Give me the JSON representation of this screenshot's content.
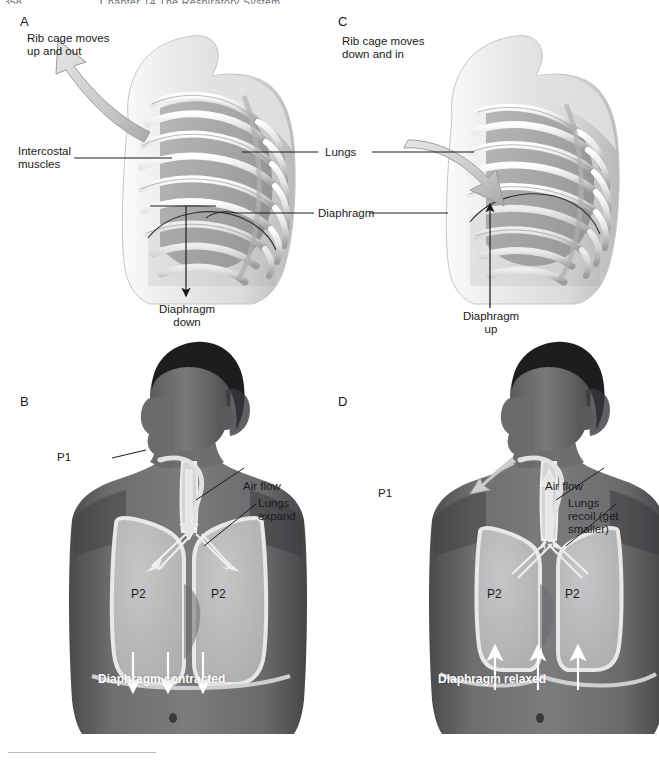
{
  "figure": {
    "running_head": "Chapter 14  The Respiratory System",
    "page_number": "358"
  },
  "panels": [
    {
      "id": "A",
      "letter": "A",
      "name": "rib-cage-inspiration",
      "labels": [
        {
          "name": "rib-cage-moves-up-and-out",
          "text": "Rib cage moves\nup and out"
        },
        {
          "name": "intercostal-muscles",
          "text": "Intercostal\nmuscles"
        },
        {
          "name": "diaphragm-down",
          "text": "Diaphragm\ndown"
        }
      ]
    },
    {
      "id": "C",
      "letter": "C",
      "name": "rib-cage-expiration",
      "labels": [
        {
          "name": "rib-cage-moves-down-and-in",
          "text": "Rib cage moves\ndown and in"
        },
        {
          "name": "diaphragm-up",
          "text": "Diaphragm\nup"
        }
      ]
    },
    {
      "id": "B",
      "letter": "B",
      "name": "torso-inspiration",
      "labels": [
        {
          "name": "pressure-p1",
          "text": "P1"
        },
        {
          "name": "air-flow",
          "text": "Air flow"
        },
        {
          "name": "lungs-expand",
          "text": "Lungs\nexpand"
        },
        {
          "name": "pressure-p2-left",
          "text": "P2"
        },
        {
          "name": "pressure-p2-right",
          "text": "P2"
        },
        {
          "name": "diaphragm-contracted",
          "text": "Diaphragm contracted"
        }
      ]
    },
    {
      "id": "D",
      "letter": "D",
      "name": "torso-expiration",
      "labels": [
        {
          "name": "pressure-p1",
          "text": "P1"
        },
        {
          "name": "air-flow",
          "text": "Air flow"
        },
        {
          "name": "lungs-recoil",
          "text": "Lungs\nrecoil (get\nsmaller)"
        },
        {
          "name": "pressure-p2-left",
          "text": "P2"
        },
        {
          "name": "pressure-p2-right",
          "text": "P2"
        },
        {
          "name": "diaphragm-relaxed",
          "text": "Diaphragm relaxed"
        }
      ]
    }
  ],
  "shared_labels": {
    "lungs": "Lungs",
    "diaphragm": "Diaphragm"
  },
  "colors": {
    "ink": "#1a1a1a",
    "bone_light": "#f2f2f2",
    "bone_mid": "#c8c8ca",
    "bone_dark": "#8d8d90",
    "muscle": "#6f6f72",
    "skin_dark": "#555558",
    "skin_mid": "#6d6d70",
    "lung_fill": "#b5b5b7",
    "lung_outline": "#e8e8e8",
    "arrow_gray": "#c4c4c6",
    "white": "#ffffff"
  }
}
